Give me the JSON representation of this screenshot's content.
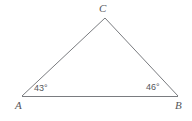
{
  "figure": {
    "type": "triangle-diagram",
    "shape_name": "triangle ABC",
    "background_color": "#ffffff",
    "stroke_color": "#7a7c80",
    "text_color": "#55565a",
    "stroke_width": 1,
    "vertices": [
      {
        "name": "A",
        "label": "A",
        "x": 22,
        "y": 96,
        "label_x": 15,
        "label_y": 100
      },
      {
        "name": "B",
        "label": "B",
        "x": 178,
        "y": 96,
        "label_x": 175,
        "label_y": 100
      },
      {
        "name": "C",
        "label": "C",
        "x": 105,
        "y": 18,
        "label_x": 99,
        "label_y": 3
      }
    ],
    "sides": [
      {
        "name": "AB",
        "from": "A",
        "to": "B"
      },
      {
        "name": "AC",
        "from": "A",
        "to": "C"
      },
      {
        "name": "CB",
        "from": "C",
        "to": "B"
      }
    ],
    "angles": [
      {
        "at_vertex": "A",
        "label": "43°",
        "value": 43,
        "unit": "degrees",
        "label_x": 34,
        "label_y": 84
      },
      {
        "at_vertex": "B",
        "label": "46°",
        "value": 46,
        "unit": "degrees",
        "label_x": 146,
        "label_y": 83
      }
    ]
  }
}
